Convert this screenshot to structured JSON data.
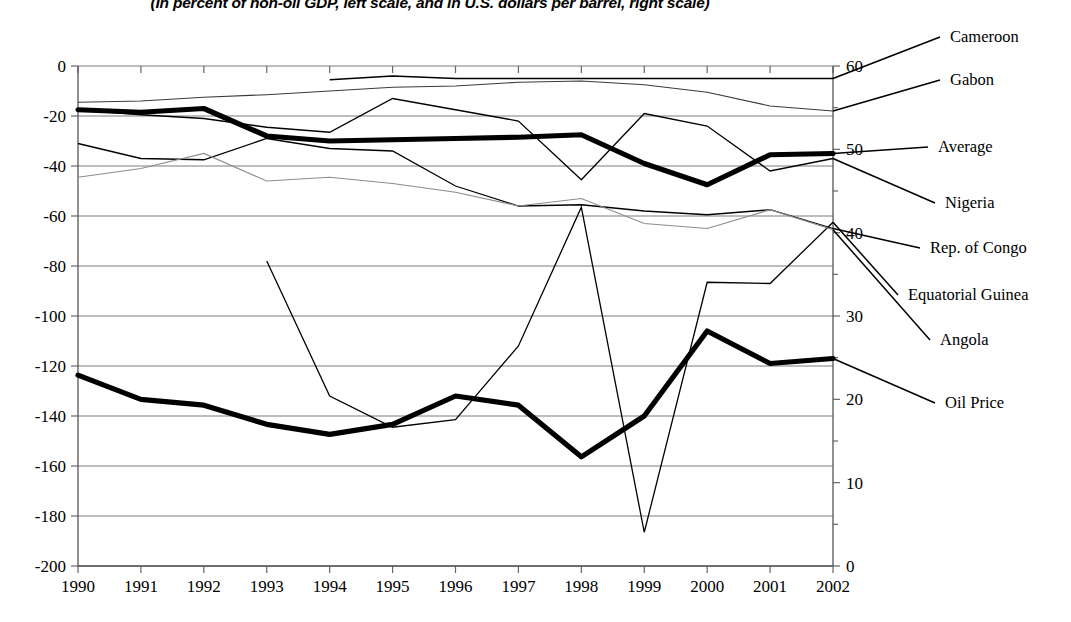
{
  "title": "(In percent of non-oil GDP, left scale, and in U.S. dollars per barrel, right scale)",
  "axes": {
    "left_ticks": [
      "0",
      "-20",
      "-40",
      "-60",
      "-80",
      "-100",
      "-120",
      "-140",
      "-160",
      "-180",
      "-200"
    ],
    "right_ticks": [
      "60",
      "50",
      "40",
      "30",
      "20",
      "10",
      "0"
    ],
    "x_ticks": [
      "1990",
      "1991",
      "1992",
      "1993",
      "1994",
      "1995",
      "1996",
      "1997",
      "1998",
      "1999",
      "2000",
      "2001",
      "2002"
    ]
  },
  "legend": {
    "items": [
      {
        "label": "Cameroon",
        "style": "thin"
      },
      {
        "label": "Gabon",
        "style": "thin"
      },
      {
        "label": "Average",
        "style": "bold"
      },
      {
        "label": "Nigeria",
        "style": "thin"
      },
      {
        "label": "Rep. of Congo",
        "style": "thin"
      },
      {
        "label": "Equatorial Guinea",
        "style": "thin"
      },
      {
        "label": "Angola",
        "style": "gray"
      },
      {
        "label": "Oil Price",
        "style": "bold"
      }
    ]
  },
  "chart_data": {
    "type": "line",
    "title": "(In percent of non-oil GDP, left scale, and in U.S. dollars per barrel, right scale)",
    "xlabel": "",
    "ylabel": "Percent of non-oil GDP",
    "ylabel_right": "U.S. dollars per barrel",
    "x": [
      1990,
      1991,
      1992,
      1993,
      1994,
      1995,
      1996,
      1997,
      1998,
      1999,
      2000,
      2001,
      2002
    ],
    "ylim": [
      -200,
      0
    ],
    "ylim_right": [
      0,
      60
    ],
    "grid": true,
    "legend_position": "right-leader-lines",
    "series": [
      {
        "name": "Cameroon",
        "axis": "left",
        "style": "thin",
        "x": [
          1994,
          1995,
          1996,
          1997,
          1998,
          1999,
          2000,
          2001,
          2002
        ],
        "values": [
          -5.5,
          -4.0,
          -5.0,
          -5.0,
          -5.0,
          -5.0,
          -5.0,
          -5.0,
          -5.0
        ]
      },
      {
        "name": "Gabon",
        "axis": "left",
        "style": "thin-light",
        "x": [
          1990,
          1991,
          1992,
          1993,
          1994,
          1995,
          1996,
          1997,
          1998,
          1999,
          2000,
          2001,
          2002
        ],
        "values": [
          -14.5,
          -14.0,
          -12.5,
          -11.5,
          -10.0,
          -8.5,
          -8.0,
          -6.5,
          -6.0,
          -7.5,
          -10.5,
          -16.0,
          -18.0
        ]
      },
      {
        "name": "Average",
        "axis": "left",
        "style": "bold",
        "x": [
          1990,
          1991,
          1992,
          1993,
          1994,
          1995,
          1996,
          1997,
          1998,
          1999,
          2000,
          2001,
          2002
        ],
        "values": [
          -17.5,
          -18.5,
          -17.0,
          -28.0,
          -30.0,
          -29.5,
          -29.0,
          -28.5,
          -27.5,
          -39.0,
          -47.5,
          -35.5,
          -35.0
        ]
      },
      {
        "name": "Nigeria",
        "axis": "left",
        "style": "thin",
        "x": [
          1990,
          1991,
          1992,
          1993,
          1994,
          1995,
          1996,
          1997,
          1998,
          1999,
          2000,
          2001,
          2002
        ],
        "values": [
          -17.5,
          -19.5,
          -21.0,
          -24.5,
          -26.5,
          -13.0,
          -17.5,
          -22.0,
          -45.5,
          -19.0,
          -24.0,
          -42.0,
          -37.0
        ]
      },
      {
        "name": "Rep. of Congo",
        "axis": "left",
        "style": "thin",
        "x": [
          1990,
          1991,
          1992,
          1993,
          1994,
          1995,
          1996,
          1997,
          1998,
          1999,
          2000,
          2001,
          2002
        ],
        "values": [
          -31.0,
          -37.0,
          -37.5,
          -29.0,
          -33.0,
          -34.0,
          -48.0,
          -56.0,
          -55.5,
          -58.0,
          -59.5,
          -57.5,
          -65.0
        ]
      },
      {
        "name": "Equatorial Guinea",
        "axis": "left",
        "style": "thin",
        "x": [
          1993,
          1994,
          1995,
          1996,
          1997,
          1998,
          1999,
          2000,
          2001,
          2002
        ],
        "values": [
          -78.0,
          -132.0,
          -144.5,
          -141.5,
          -112.0,
          -56.5,
          -186.5,
          -86.5,
          -87.0,
          -62.5
        ]
      },
      {
        "name": "Angola",
        "axis": "left",
        "style": "gray",
        "x": [
          1990,
          1991,
          1992,
          1993,
          1994,
          1995,
          1996,
          1997,
          1998,
          1999,
          2000,
          2001,
          2002
        ],
        "values": [
          -44.5,
          -41.0,
          -35.0,
          -46.0,
          -44.5,
          -47.0,
          -50.5,
          -56.0,
          -53.0,
          -63.0,
          -65.0,
          -57.5,
          -65.5
        ]
      },
      {
        "name": "Oil Price",
        "axis": "right",
        "style": "bold",
        "x": [
          1990,
          1991,
          1992,
          1993,
          1994,
          1995,
          1996,
          1997,
          1998,
          1999,
          2000,
          2001,
          2002
        ],
        "values": [
          22.9,
          20.0,
          19.3,
          17.0,
          15.8,
          17.0,
          20.4,
          19.3,
          13.1,
          18.0,
          28.2,
          24.3,
          24.9
        ]
      }
    ]
  }
}
